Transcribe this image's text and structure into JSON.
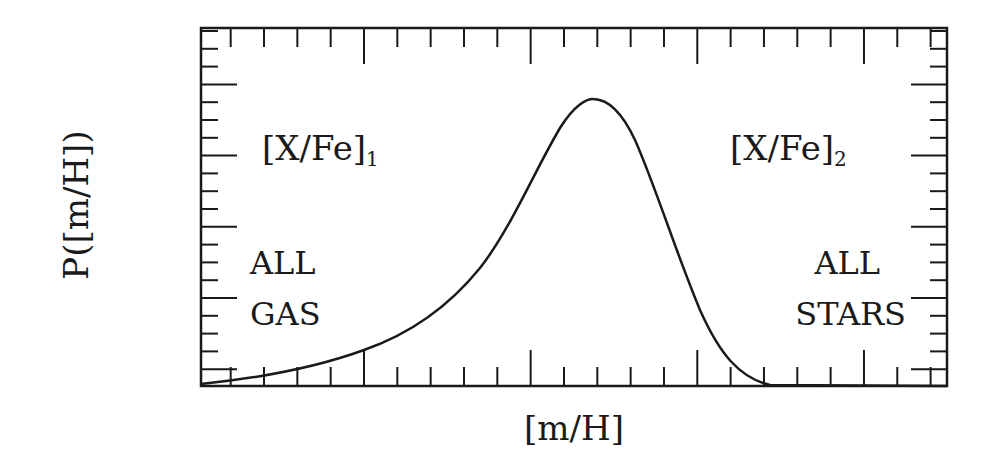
{
  "chart_data": {
    "type": "line",
    "title": "",
    "xlabel": "[m/H]",
    "ylabel": "P([m/H])",
    "grid": false,
    "legend": null,
    "x_tick_labels": [],
    "y_tick_labels": [],
    "xlim": [
      0,
      1
    ],
    "ylim": [
      0,
      1
    ],
    "series": [
      {
        "name": "metallicity distribution",
        "x": [
          0.0,
          0.05,
          0.1,
          0.15,
          0.22,
          0.28,
          0.33,
          0.38,
          0.42,
          0.46,
          0.49,
          0.51,
          0.53,
          0.56,
          0.59,
          0.62,
          0.66,
          0.7,
          0.74,
          0.8,
          0.9,
          1.0
        ],
        "y": [
          0.005,
          0.03,
          0.06,
          0.1,
          0.19,
          0.32,
          0.49,
          0.69,
          0.85,
          0.96,
          1.0,
          0.99,
          0.95,
          0.82,
          0.63,
          0.42,
          0.18,
          0.05,
          0.01,
          0.0,
          0.0,
          0.0
        ]
      }
    ],
    "annotations": [
      {
        "text": "[X/Fe]",
        "subscript": "1",
        "position": "upper-left"
      },
      {
        "text": "[X/Fe]",
        "subscript": "2",
        "position": "upper-right"
      },
      {
        "lines": [
          "ALL",
          "GAS"
        ],
        "position": "lower-left"
      },
      {
        "lines": [
          "ALL",
          "STARS"
        ],
        "position": "lower-right"
      }
    ]
  },
  "labels": {
    "xlabel": "[m/H]",
    "ylabel": "P([m/H])",
    "left_regime_base": "[X/Fe]",
    "left_regime_sub": "1",
    "right_regime_base": "[X/Fe]",
    "right_regime_sub": "2",
    "left_end_line1": "ALL",
    "left_end_line2": "GAS",
    "right_end_line1": "ALL",
    "right_end_line2": "STARS"
  }
}
